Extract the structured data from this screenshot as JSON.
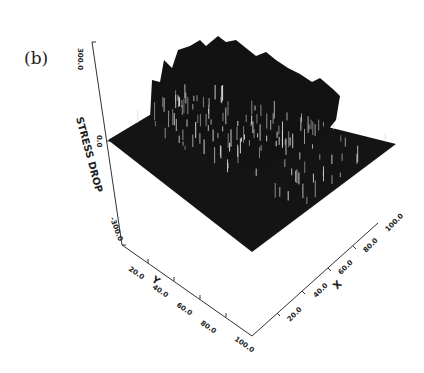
{
  "panel_label": "(b)",
  "chart_data": {
    "type": "surface3d",
    "title": "",
    "zlabel": "STRESS DROP",
    "xlabel": "X",
    "ylabel": "Y",
    "zlim": [
      -300.0,
      300.0
    ],
    "xlim": [
      0,
      100.0
    ],
    "ylim": [
      0,
      100.0
    ],
    "z_ticks": [
      "300.0",
      "0.0",
      "-300.0"
    ],
    "x_ticks": [
      "20.0",
      "40.0",
      "60.0",
      "80.0",
      "100.0"
    ],
    "y_ticks": [
      "20.0",
      "40.0",
      "60.0",
      "80.0",
      "100.0"
    ],
    "base_level": 0.0,
    "spike_region": {
      "x_range": [
        0,
        100
      ],
      "y_range": [
        0,
        60
      ]
    },
    "colors": {
      "surface": "#111111",
      "highlight": "#dddddd",
      "axes": "#333333"
    }
  }
}
